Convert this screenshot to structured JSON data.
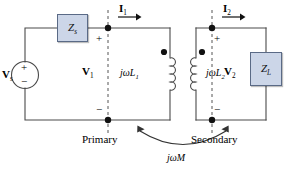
{
  "figure": {
    "type": "circuit-diagram",
    "background_color": "#ffffff",
    "wire_color": "#4a4a4a",
    "text_color": "#000000",
    "box_fill": "#ccd6e8",
    "box_stroke": "#5a6a86",
    "dashed_color": "#555555"
  },
  "components": {
    "source": {
      "name": "voltage-source",
      "label": "V",
      "label_sub": "s",
      "plus": "+",
      "minus": "−"
    },
    "source_impedance": {
      "name": "source-impedance",
      "label": "Z",
      "label_sub": "s"
    },
    "load_impedance": {
      "name": "load-impedance",
      "label": "Z",
      "label_sub": "L"
    },
    "primary_inductor": {
      "name": "primary-inductor",
      "label": "jωL",
      "label_sub": "1"
    },
    "secondary_inductor": {
      "name": "secondary-inductor",
      "label": "jωL",
      "label_sub": "2"
    },
    "mutual_inductance": {
      "name": "mutual-inductance",
      "label": "jωM"
    }
  },
  "currents": {
    "i1": {
      "label": "I",
      "label_sub": "1"
    },
    "i2": {
      "label": "I",
      "label_sub": "2"
    }
  },
  "voltages": {
    "v1": {
      "label": "V",
      "label_sub": "1",
      "plus": "+",
      "minus": "−"
    },
    "v2": {
      "label": "V",
      "label_sub": "2",
      "plus": "+",
      "minus": "−"
    }
  },
  "annotations": {
    "primary": "Primary",
    "secondary": "Secondary"
  }
}
